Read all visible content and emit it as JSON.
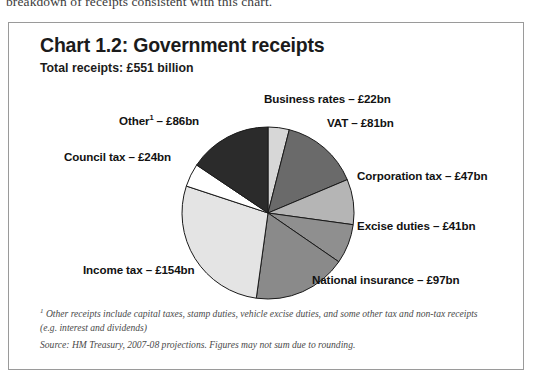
{
  "document": {
    "clipped_line": "breakdown of receipts consistent with this chart."
  },
  "chart_box": {
    "title": "Chart 1.2: Government receipts",
    "subtitle": "Total receipts: £551 billion",
    "footnote_marker": "1",
    "footnote": " Other receipts include capital taxes, stamp duties, vehicle excise duties, and some other tax and non-tax receipts (e.g. interest and dividends)",
    "source": "Source: HM Treasury, 2007-08 projections. Figures may not sum due to rounding."
  },
  "labels": {
    "business_rates": "Business rates – £22bn",
    "vat": "VAT – £81bn",
    "corporation_tax": "Corporation tax – £47bn",
    "excise_duties": "Excise duties – £41bn",
    "national_insurance": "National insurance – £97bn",
    "income_tax": "Income tax – £154bn",
    "council_tax": "Council tax – £24bn",
    "other_prefix": "Other",
    "other_sup": "1",
    "other_suffix": " – £86bn"
  },
  "chart_data": {
    "type": "pie",
    "title": "Chart 1.2: Government receipts",
    "subtitle": "Total receipts: £551 billion",
    "unit": "£ billion",
    "total": 551,
    "start_angle_deg": 0,
    "direction": "clockwise",
    "legend_position": "callout-labels",
    "categories": [
      "Business rates",
      "VAT",
      "Corporation tax",
      "Excise duties",
      "National insurance",
      "Income tax",
      "Council tax",
      "Other"
    ],
    "values": [
      22,
      81,
      47,
      41,
      97,
      154,
      24,
      86
    ],
    "value_labels": [
      "£22bn",
      "£81bn",
      "£47bn",
      "£41bn",
      "£97bn",
      "£154bn",
      "£24bn",
      "£86bn"
    ],
    "colors": [
      "#d7d7d7",
      "#6a6a6a",
      "#b5b5b5",
      "#8f8f8f",
      "#8a8a8a",
      "#e4e4e4",
      "#ffffff",
      "#2b2b2b"
    ],
    "stroke": "#1a1a1a",
    "annotations": [
      "1 Other receipts include capital taxes, stamp duties, vehicle excise duties, and some other tax and non-tax receipts (e.g. interest and dividends)",
      "Source: HM Treasury, 2007-08 projections. Figures may not sum due to rounding."
    ]
  }
}
